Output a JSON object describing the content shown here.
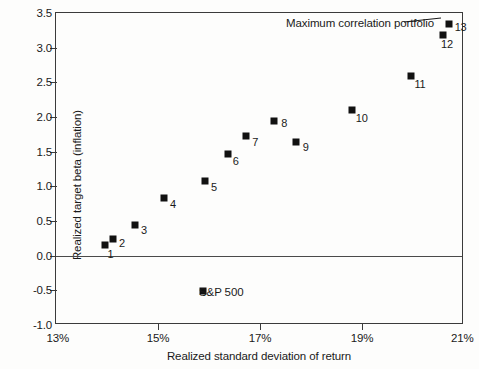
{
  "chart_data": {
    "type": "scatter",
    "title": "",
    "xlabel": "Realized standard deviation of return",
    "ylabel": "Realized target beta (inflation)",
    "xlim": [
      13,
      21
    ],
    "ylim": [
      -1.0,
      3.5
    ],
    "xticks": [
      "13%",
      "15%",
      "17%",
      "19%",
      "21%"
    ],
    "xtick_values": [
      13,
      15,
      17,
      19,
      21
    ],
    "yticks": [
      "3.5",
      "3.0",
      "2.5",
      "2.0",
      "1.5",
      "1.0",
      "0.5",
      "0.0",
      "-0.5",
      "-1.0"
    ],
    "ytick_values": [
      3.5,
      3.0,
      2.5,
      2.0,
      1.5,
      1.0,
      0.5,
      0.0,
      -0.5,
      -1.0
    ],
    "grid": false,
    "legend": "none",
    "zero_line": true,
    "series": [
      {
        "name": "Portfolios",
        "marker": "filled-square",
        "color": "#111111",
        "points": [
          {
            "label": "1",
            "x": 13.97,
            "y": 0.15,
            "label_dx": 2,
            "label_dy": 9
          },
          {
            "label": "2",
            "x": 14.12,
            "y": 0.24,
            "label_dx": 6,
            "label_dy": 4
          },
          {
            "label": "3",
            "x": 14.55,
            "y": 0.44,
            "label_dx": 6,
            "label_dy": 5
          },
          {
            "label": "4",
            "x": 15.12,
            "y": 0.83,
            "label_dx": 6,
            "label_dy": 6
          },
          {
            "label": "5",
            "x": 15.92,
            "y": 1.07,
            "label_dx": 6,
            "label_dy": 6
          },
          {
            "label": "6",
            "x": 16.37,
            "y": 1.47,
            "label_dx": 5,
            "label_dy": 7
          },
          {
            "label": "7",
            "x": 16.73,
            "y": 1.72,
            "label_dx": 6,
            "label_dy": 6
          },
          {
            "label": "8",
            "x": 17.28,
            "y": 1.94,
            "label_dx": 7,
            "label_dy": 2
          },
          {
            "label": "9",
            "x": 17.7,
            "y": 1.64,
            "label_dx": 7,
            "label_dy": 5
          },
          {
            "label": "10",
            "x": 18.8,
            "y": 2.1,
            "label_dx": 4,
            "label_dy": 8
          },
          {
            "label": "11",
            "x": 19.97,
            "y": 2.59,
            "label_dx": 3,
            "label_dy": 8
          },
          {
            "label": "12",
            "x": 20.59,
            "y": 3.18,
            "label_dx": -2,
            "label_dy": 9
          },
          {
            "label": "13",
            "x": 20.7,
            "y": 3.34,
            "label_dx": 6,
            "label_dy": 3
          }
        ]
      },
      {
        "name": "S&P 500",
        "marker": "filled-square",
        "color": "#111111",
        "points": [
          {
            "label": "",
            "x": 15.88,
            "y": -0.51,
            "label_dx": 0,
            "label_dy": 0
          }
        ]
      }
    ],
    "annotations": [
      {
        "name": "maximum-correlation-portfolio",
        "text": "Maximum correlation portfolio",
        "text_left": 286,
        "text_top": 17,
        "leader": {
          "x1": 404,
          "y1": 22,
          "x2": 441,
          "y2": 18
        }
      },
      {
        "name": "sp500",
        "text": "S&P 500",
        "text_left": 199,
        "text_top": 286
      }
    ]
  },
  "colors": {
    "marker": "#111111",
    "axis": "#3b3b3b",
    "zero_line": "#4a4a4a",
    "text": "#1a1a1a",
    "background": "#fdfdfc"
  }
}
